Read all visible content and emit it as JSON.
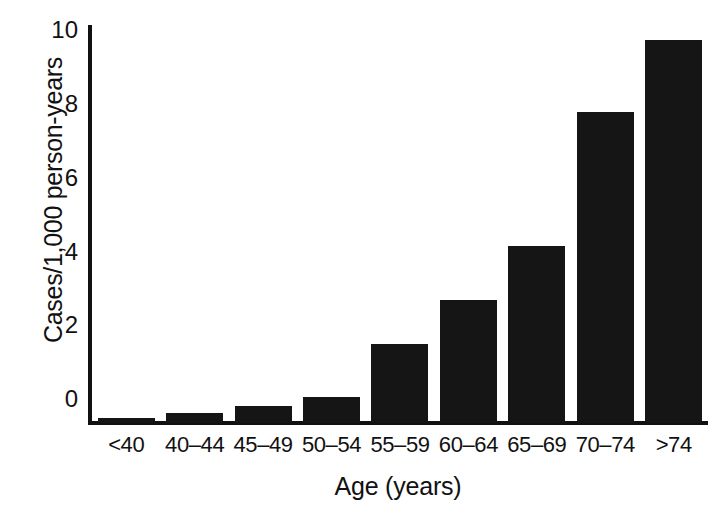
{
  "chart_data": {
    "type": "bar",
    "title": "",
    "subtitle": "",
    "xlabel": "Age (years)",
    "ylabel": "Cases/1,000 person-years",
    "categories": [
      "<40",
      "40–44",
      "45–49",
      "50–54",
      "55–59",
      "60–64",
      "65–69",
      "70–74",
      ">74"
    ],
    "values": [
      0.13,
      0.28,
      0.45,
      0.7,
      2.15,
      3.35,
      4.8,
      8.45,
      10.4
    ],
    "yticks": [
      0,
      2,
      4,
      6,
      8,
      10
    ],
    "ytick_labels": [
      "0",
      "2",
      "4",
      "6",
      "8",
      "10"
    ],
    "ylim": [
      0,
      10.8
    ],
    "grid": false,
    "legend": null,
    "bar_color": "#151515",
    "axis_color": "#111111",
    "background_color": "#ffffff"
  }
}
